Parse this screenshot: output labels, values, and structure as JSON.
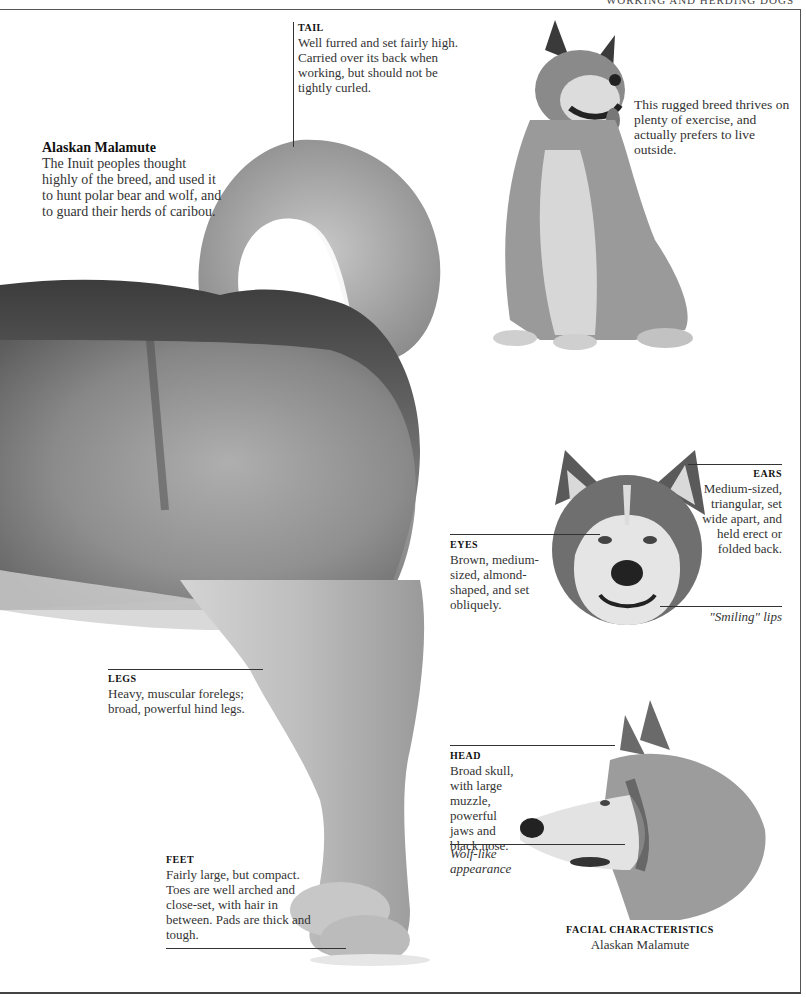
{
  "running_head": "Working and Herding Dogs",
  "intro": {
    "title": "Alaskan Malamute",
    "text": "The Inuit peoples thought highly of the breed, and used it to hunt polar bear and wolf, and to guard their herds of caribou."
  },
  "side_note": "This rugged breed thrives on plenty of exercise, and actually prefers to live outside.",
  "callouts": {
    "tail": {
      "heading": "TAIL",
      "text": "Well furred and set fairly high. Carried over its back when working, but should not be tightly curled."
    },
    "ears": {
      "heading": "EARS",
      "text": "Medium-sized, triangular, set wide apart, and held erect or folded back."
    },
    "eyes": {
      "heading": "EYES",
      "text": "Brown, medium-sized, almond-shaped, and set obliquely."
    },
    "lips": {
      "text": "\"Smiling\" lips"
    },
    "legs": {
      "heading": "LEGS",
      "text": "Heavy, muscular forelegs; broad, powerful hind legs."
    },
    "head": {
      "heading": "HEAD",
      "text": "Broad skull, with large muzzle, powerful jaws and black nose."
    },
    "wolf": {
      "text": "Wolf-like appearance"
    },
    "feet": {
      "heading": "FEET",
      "text": "Fairly large, but compact. Toes are well arched and close-set, with hair in between. Pads are thick and tough."
    }
  },
  "facial_caption": {
    "heading": "FACIAL CHARACTERISTICS",
    "subtitle": "Alaskan Malamute"
  },
  "images": {
    "main": "alaskan-malamute-rear-body-photo",
    "sitting": "alaskan-malamute-sitting-photo",
    "front_head": "alaskan-malamute-head-front-photo",
    "profile_head": "alaskan-malamute-head-profile-photo"
  }
}
